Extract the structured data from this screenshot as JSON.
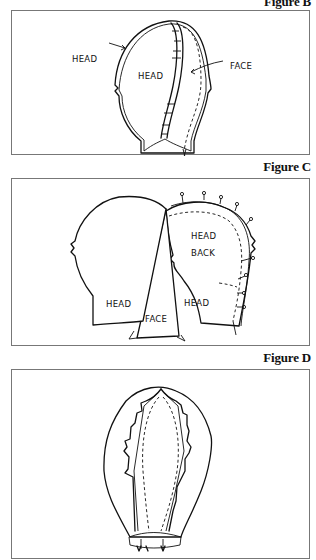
{
  "figures": [
    {
      "caption": "Figure B",
      "labels": {
        "head_outer": "HEAD",
        "head_inner": "HEAD",
        "face": "FACE"
      }
    },
    {
      "caption": "Figure C",
      "labels": {
        "head_left": "HEAD",
        "face": "FACE",
        "head_right": "HEAD",
        "head_back_1": "HEAD",
        "head_back_2": "BACK"
      }
    },
    {
      "caption": "Figure D",
      "labels": {}
    }
  ],
  "colors": {
    "line": "#111111",
    "border": "#777777",
    "background": "#ffffff"
  }
}
